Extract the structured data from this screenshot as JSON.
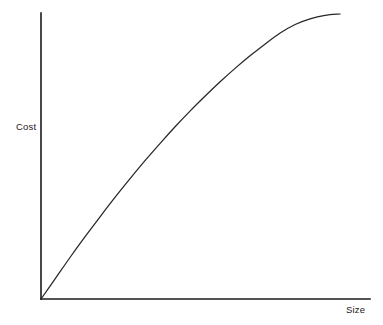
{
  "chart_data": {
    "type": "line",
    "title": "",
    "subtitle": "",
    "xlabel": "Size",
    "ylabel": "Cost",
    "grid": false,
    "legend": false,
    "legend_position": "none",
    "xlim": [
      0,
      1
    ],
    "ylim": [
      0,
      1
    ],
    "xticks": [],
    "yticks": [],
    "xticklabels": [],
    "yticklabels": [],
    "annotations": [],
    "series": [
      {
        "name": "Cost vs Size",
        "shape": "concave-increasing",
        "color": "#262626",
        "x": [
          0.0,
          0.05,
          0.1,
          0.15,
          0.2,
          0.25,
          0.3,
          0.35,
          0.4,
          0.45,
          0.5,
          0.55,
          0.6,
          0.65,
          0.7,
          0.75,
          0.8,
          0.85,
          0.9,
          0.95,
          1.0
        ],
        "y": [
          0.0,
          0.075,
          0.15,
          0.222,
          0.292,
          0.36,
          0.425,
          0.488,
          0.548,
          0.606,
          0.661,
          0.713,
          0.763,
          0.81,
          0.854,
          0.895,
          0.933,
          0.963,
          0.983,
          0.995,
          1.0
        ]
      }
    ]
  },
  "chart": {
    "colors": {
      "background": "#ffffff",
      "axis": "#1b1b1b",
      "curve": "#262626",
      "label_text": "#1a1a1a"
    },
    "geometry": {
      "origin_x": 41,
      "origin_y": 299,
      "plot_right": 340,
      "plot_top": 14,
      "xaxis_end": 370,
      "yaxis_top": 13
    }
  }
}
